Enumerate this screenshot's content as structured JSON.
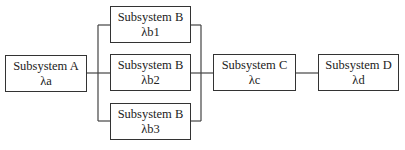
{
  "diagram": {
    "type": "reliability block diagram",
    "blocks": [
      {
        "id": "A",
        "name": "Subsystem A",
        "rate": "λa"
      },
      {
        "id": "B1",
        "name": "Subsystem B",
        "rate": "λb1"
      },
      {
        "id": "B2",
        "name": "Subsystem B",
        "rate": "λb2"
      },
      {
        "id": "B3",
        "name": "Subsystem B",
        "rate": "λb3"
      },
      {
        "id": "C",
        "name": "Subsystem C",
        "rate": "λc"
      },
      {
        "id": "D",
        "name": "Subsystem D",
        "rate": "λd"
      }
    ],
    "connections": [
      {
        "from": "A",
        "to": "B1"
      },
      {
        "from": "A",
        "to": "B2"
      },
      {
        "from": "A",
        "to": "B3"
      },
      {
        "from": "B1",
        "to": "C"
      },
      {
        "from": "B2",
        "to": "C"
      },
      {
        "from": "B3",
        "to": "C"
      },
      {
        "from": "C",
        "to": "D"
      }
    ],
    "colors": {
      "line": "#333333",
      "background": "#ffffff"
    }
  }
}
